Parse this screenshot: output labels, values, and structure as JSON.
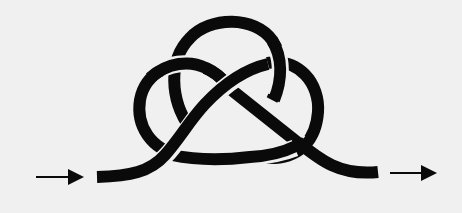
{
  "diagram": {
    "kind": "knot-diagram",
    "colors": {
      "background": "#f0f0f0",
      "rope": "#0a0a0a"
    },
    "direction": {
      "entry_arrow": "arrow-right",
      "exit_arrow": "arrow-right"
    },
    "lobes": [
      "top-loop",
      "left-loop",
      "right-loop"
    ],
    "crossings": 6
  }
}
